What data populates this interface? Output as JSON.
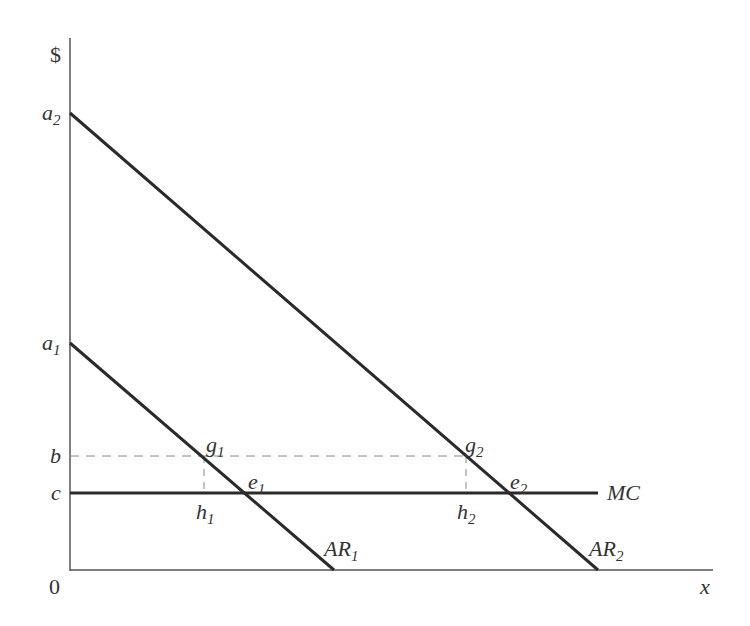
{
  "diagram": {
    "y_axis_label": "$",
    "x_axis_label": "x",
    "origin_label": "0",
    "y_ticks": [
      {
        "base": "a",
        "sub": "2"
      },
      {
        "base": "a",
        "sub": "1"
      },
      {
        "base": "b",
        "sub": ""
      },
      {
        "base": "c",
        "sub": ""
      }
    ],
    "curves": [
      {
        "name": "AR",
        "sub": "1"
      },
      {
        "name": "AR",
        "sub": "2"
      },
      {
        "name": "MC",
        "sub": ""
      }
    ],
    "points": [
      {
        "base": "g",
        "sub": "1"
      },
      {
        "base": "e",
        "sub": "1"
      },
      {
        "base": "h",
        "sub": "1"
      },
      {
        "base": "g",
        "sub": "2"
      },
      {
        "base": "e",
        "sub": "2"
      },
      {
        "base": "h",
        "sub": "2"
      }
    ],
    "colors": {
      "axis": "#555555",
      "curve": "#2a2a2a",
      "dashed": "#888888",
      "text": "#333333"
    }
  }
}
